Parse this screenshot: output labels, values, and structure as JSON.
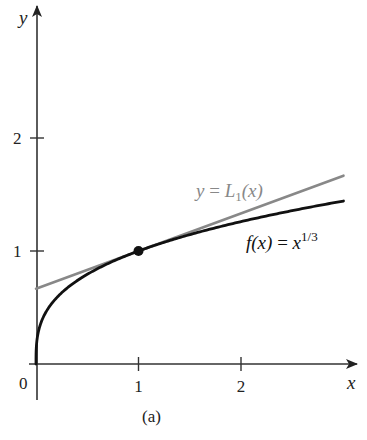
{
  "chart_data": {
    "type": "line",
    "title": "",
    "caption": "(a)",
    "xlabel": "x",
    "ylabel": "y",
    "xlim": [
      0,
      3.15
    ],
    "ylim": [
      0,
      3.15
    ],
    "x_ticks": [
      {
        "value": 0,
        "label": "0"
      },
      {
        "value": 1,
        "label": "1"
      },
      {
        "value": 2,
        "label": "2"
      }
    ],
    "y_ticks": [
      {
        "value": 1,
        "label": "1"
      },
      {
        "value": 2,
        "label": "2"
      }
    ],
    "grid": false,
    "series": [
      {
        "name": "f(x) = x^{1/3}",
        "label_parts": {
          "func": "f",
          "arg": "(x)",
          "eq": " = ",
          "base": "x",
          "exp": "1/3"
        },
        "color": "#111111",
        "function": "cbrt",
        "x_range": [
          0,
          3.0
        ],
        "sample_points": [
          {
            "x": 0,
            "y": 0
          },
          {
            "x": 0.125,
            "y": 0.5
          },
          {
            "x": 0.5,
            "y": 0.794
          },
          {
            "x": 1,
            "y": 1
          },
          {
            "x": 2,
            "y": 1.26
          },
          {
            "x": 3,
            "y": 1.442
          }
        ]
      },
      {
        "name": "y = L_1(x)",
        "label_parts": {
          "lhs": "y",
          "eq": " = ",
          "func": "L",
          "sub": "1",
          "arg": "(x)"
        },
        "color": "#888888",
        "function": "linear",
        "slope": 0.3333,
        "intercept": 0.6667,
        "x_range": [
          0,
          3.0
        ],
        "sample_points": [
          {
            "x": 0,
            "y": 0.667
          },
          {
            "x": 1,
            "y": 1
          },
          {
            "x": 3,
            "y": 1.667
          }
        ]
      }
    ],
    "annotations": [
      {
        "type": "point",
        "x": 1,
        "y": 1,
        "label": "point of tangency (1, 1)"
      }
    ]
  },
  "layout": {
    "origin_px": [
      36,
      364
    ],
    "x_unit_px": 102.5,
    "y_unit_px": 113
  }
}
